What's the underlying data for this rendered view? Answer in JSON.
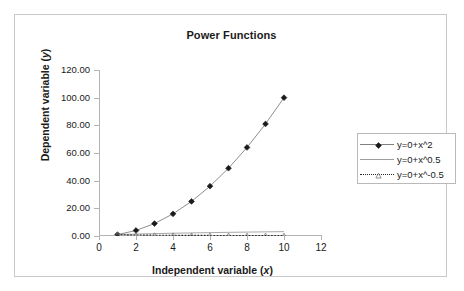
{
  "chart_data": {
    "type": "line",
    "title": "Power Functions",
    "xlabel": "Independent variable (x)",
    "ylabel": "Dependent variable (y)",
    "xlim": [
      0,
      12
    ],
    "ylim": [
      0,
      120
    ],
    "xticks": [
      "0",
      "2",
      "4",
      "6",
      "8",
      "10",
      "12"
    ],
    "xtick_values": [
      0,
      2,
      4,
      6,
      8,
      10,
      12
    ],
    "yticks": [
      "0.00",
      "20.00",
      "40.00",
      "60.00",
      "80.00",
      "100.00",
      "120.00"
    ],
    "ytick_values": [
      0,
      20,
      40,
      60,
      80,
      100,
      120
    ],
    "grid": false,
    "legend_position": "right",
    "x": [
      1,
      2,
      3,
      4,
      5,
      6,
      7,
      8,
      9,
      10
    ],
    "series": [
      {
        "name": "y=0+x^2",
        "marker": "diamond",
        "linestyle": "solid",
        "color": "#808080",
        "marker_color": "#1a1a1a",
        "values": [
          1,
          4,
          9,
          16,
          25,
          36,
          49,
          64,
          81,
          100
        ]
      },
      {
        "name": "y=0+x^0.5",
        "marker": "none",
        "linestyle": "solid",
        "color": "#9e9e9e",
        "marker_color": "#9e9e9e",
        "values": [
          1,
          1.41,
          1.73,
          2,
          2.24,
          2.45,
          2.65,
          2.83,
          3,
          3.16
        ]
      },
      {
        "name": "y=0+x^-0.5",
        "marker": "triangle",
        "linestyle": "dotted",
        "color": "#262626",
        "marker_color": "#7a7a7a",
        "values": [
          1,
          0.71,
          0.58,
          0.5,
          0.45,
          0.41,
          0.38,
          0.35,
          0.33,
          0.32
        ]
      }
    ]
  },
  "axis_titles": {
    "x_prefix": "Independent variable (",
    "x_var": "x",
    "x_suffix": ")",
    "y_prefix": "Dependent variable (",
    "y_var": "y",
    "y_suffix": ")"
  },
  "colors": {
    "frame": "#c9c9c9",
    "axis": "#b4b4b4",
    "text": "#1a1a1a",
    "legend_border": "#b9b9b9",
    "background": "#ffffff"
  }
}
